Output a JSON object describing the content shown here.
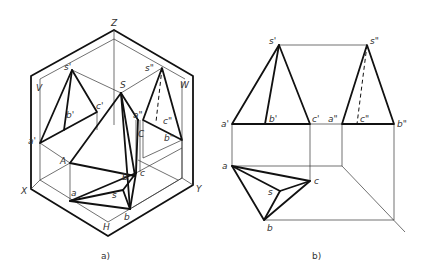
{
  "figure_a": {
    "caption": "a)",
    "axes": {
      "z": "Z",
      "x": "X",
      "y": "Y"
    },
    "planes": {
      "v": "V",
      "w": "W",
      "h": "H"
    },
    "points": {
      "s_v": "s'",
      "a_v": "a'",
      "b_v": "b'",
      "c_v": "c'",
      "s_w": "s\"",
      "a_w": "a\"",
      "b_w": "b\"",
      "c_w": "c\"",
      "S": "S",
      "A": "A",
      "B": "B",
      "C": "C",
      "s_h": "s",
      "a_h": "a",
      "b_h": "b",
      "c_h": "c"
    }
  },
  "figure_b": {
    "caption": "b)",
    "points": {
      "s_v": "s'",
      "a_v": "a'",
      "b_v": "b'",
      "c_v": "c'",
      "s_w": "s\"",
      "a_w": "a\"",
      "b_w": "b\"",
      "c_w": "c\"",
      "s_h": "s",
      "a_h": "a",
      "b_h": "b",
      "c_h": "c"
    }
  }
}
